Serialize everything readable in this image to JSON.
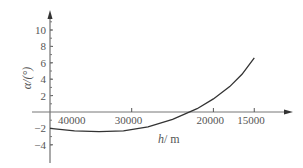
{
  "chart_data": {
    "type": "line",
    "title": "",
    "xlabel": "h/m",
    "ylabel": "α/(°)",
    "x_reversed": true,
    "x_ticks": [
      40000,
      30000,
      20000,
      15000
    ],
    "y_ticks": [
      -4,
      -2,
      2,
      4,
      6,
      8,
      10
    ],
    "xlim": [
      40000,
      13000
    ],
    "ylim": [
      -5,
      12
    ],
    "grid": false,
    "series": [
      {
        "name": "α",
        "x": [
          40000,
          37000,
          34000,
          31000,
          28000,
          25000,
          22000,
          20000,
          18000,
          16500,
          15000
        ],
        "y": [
          -2.0,
          -2.3,
          -2.4,
          -2.3,
          -1.8,
          -0.9,
          0.4,
          1.6,
          3.1,
          4.6,
          6.6
        ]
      }
    ]
  },
  "axes": {
    "x_label_var": "h",
    "x_label_unit": "/ m",
    "y_label": "α/(°)"
  }
}
